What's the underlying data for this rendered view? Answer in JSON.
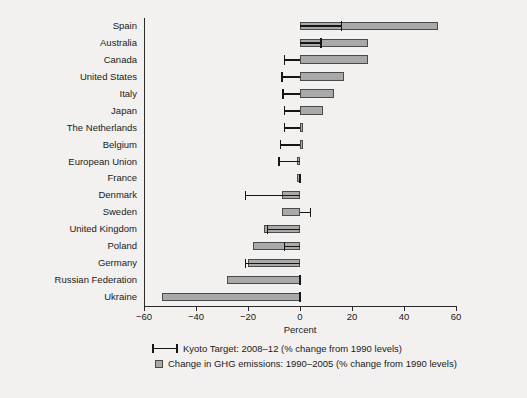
{
  "chart_data": {
    "type": "bar",
    "title": "",
    "subtitle": "",
    "xlabel": "Percent",
    "ylabel": "",
    "xlim": [
      -60,
      60
    ],
    "xticks": [
      -60,
      -40,
      -20,
      0,
      20,
      40,
      60
    ],
    "xticklabels": [
      "−60",
      "−40",
      "−20",
      "0",
      "20",
      "40",
      "60"
    ],
    "grid": false,
    "orientation": "horizontal",
    "legend_position": "below",
    "categories": [
      "Spain",
      "Australia",
      "Canada",
      "United States",
      "Italy",
      "Japan",
      "The Netherlands",
      "Belgium",
      "European Union",
      "France",
      "Denmark",
      "Sweden",
      "United Kingdom",
      "Poland",
      "Germany",
      "Russian Federation",
      "Ukraine"
    ],
    "series": [
      {
        "name": "Change in GHG emissions: 1990–2005 (% change from 1990 levels)",
        "type": "bar",
        "color": "#a9a9a9",
        "edge_color": "#4a4a4a",
        "values": [
          53,
          26,
          26,
          17,
          13,
          9,
          1,
          1,
          -1,
          -1,
          -7,
          -7,
          -14,
          -18,
          -20,
          -28,
          -53
        ]
      },
      {
        "name": "Kyoto Target: 2008–12 (% change from 1990 levels)",
        "type": "range-marker",
        "color": "#161616",
        "values": [
          16,
          8,
          -6,
          -7,
          -6.5,
          -6,
          -6,
          -7.5,
          -8,
          0,
          -21,
          4,
          -12.5,
          -6,
          -21,
          0,
          0
        ]
      }
    ]
  },
  "axis": {
    "x_title": "Percent"
  },
  "legend": {
    "items": [
      {
        "marker": "line-range-marker",
        "label": "Kyoto Target: 2008–12 (% change from 1990 levels)"
      },
      {
        "marker": "gray-square-swatch",
        "label": "Change in GHG emissions: 1990–2005 (% change from 1990 levels)"
      }
    ]
  }
}
